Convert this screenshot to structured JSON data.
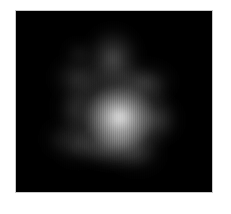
{
  "figure": {
    "type": "grayscale-intensity-map",
    "title": "",
    "background_color": "#000000",
    "page_background_color": "#ffffff",
    "border_color": "#c9c9c9",
    "colormap": "grayscale",
    "peak_color": "#e2e2e2",
    "canvas": {
      "width": 231,
      "height": 214
    },
    "plot_area": {
      "x": 15,
      "y": 10,
      "width": 198,
      "height": 183
    }
  },
  "chart_data": {
    "type": "heatmap",
    "title": "",
    "xlabel": "",
    "ylabel": "",
    "colormap": "gray",
    "grid": false,
    "legend": "none",
    "xlim": [
      0,
      196
    ],
    "ylim": [
      0,
      181
    ],
    "value_range": [
      0,
      100
    ],
    "features": [
      {
        "name": "bright-core",
        "cx": 103,
        "cy": 105,
        "rx": 34,
        "ry": 31,
        "peak_intensity": 88,
        "color": "#e0e0e0"
      },
      {
        "name": "core-halo",
        "cx": 100,
        "cy": 104,
        "rx": 52,
        "ry": 48,
        "peak_intensity": 46,
        "color": "#8a8a8a"
      },
      {
        "name": "upper-ridge",
        "cx": 96,
        "cy": 48,
        "rx": 26,
        "ry": 30,
        "peak_intensity": 40,
        "color": "#7c7c7c"
      },
      {
        "name": "upper-right-arm",
        "cx": 126,
        "cy": 70,
        "rx": 28,
        "ry": 17,
        "peak_intensity": 30,
        "color": "#5e5e5e"
      },
      {
        "name": "upper-left-shoulder",
        "cx": 62,
        "cy": 66,
        "rx": 24,
        "ry": 19,
        "peak_intensity": 28,
        "color": "#585858"
      },
      {
        "name": "detached-knot",
        "cx": 62,
        "cy": 42,
        "rx": 12,
        "ry": 9,
        "peak_intensity": 22,
        "color": "#484848"
      },
      {
        "name": "right-lobe",
        "cx": 140,
        "cy": 108,
        "rx": 20,
        "ry": 20,
        "peak_intensity": 26,
        "color": "#505050"
      },
      {
        "name": "right-faint-knot",
        "cx": 136,
        "cy": 78,
        "rx": 9,
        "ry": 7,
        "peak_intensity": 14,
        "color": "#303030"
      },
      {
        "name": "lower-left-tail",
        "cx": 62,
        "cy": 132,
        "rx": 22,
        "ry": 17,
        "peak_intensity": 27,
        "color": "#565656"
      },
      {
        "name": "lower-left-tip",
        "cx": 44,
        "cy": 126,
        "rx": 13,
        "ry": 13,
        "peak_intensity": 18,
        "color": "#3c3c3c"
      },
      {
        "name": "lower-bridge",
        "cx": 88,
        "cy": 136,
        "rx": 26,
        "ry": 14,
        "peak_intensity": 24,
        "color": "#4a4a4a"
      },
      {
        "name": "lower-right-extension",
        "cx": 120,
        "cy": 142,
        "rx": 24,
        "ry": 16,
        "peak_intensity": 22,
        "color": "#464646"
      },
      {
        "name": "left-mid-spur",
        "cx": 58,
        "cy": 96,
        "rx": 16,
        "ry": 22,
        "peak_intensity": 20,
        "color": "#414141"
      },
      {
        "name": "lower-core-skirt",
        "cx": 104,
        "cy": 128,
        "rx": 30,
        "ry": 22,
        "peak_intensity": 34,
        "color": "#6a6a6a"
      }
    ]
  }
}
